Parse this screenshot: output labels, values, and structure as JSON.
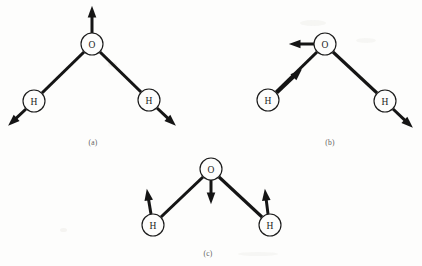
{
  "figure": {
    "background_color": "#fdfdfc",
    "ink_color": "#151515",
    "width": 422,
    "height": 266,
    "panels": [
      {
        "id": "a",
        "caption": "(a)",
        "caption_x": 93,
        "caption_y": 138,
        "mode_name": "symmetric stretch",
        "atoms": [
          {
            "label": "O",
            "name": "oxygen",
            "cx": 92,
            "cy": 44,
            "r": 11
          },
          {
            "label": "H",
            "name": "hydrogen-left",
            "cx": 34,
            "cy": 101,
            "r": 11
          },
          {
            "label": "H",
            "name": "hydrogen-right",
            "cx": 149,
            "cy": 100,
            "r": 11
          }
        ],
        "bonds": [
          {
            "name": "bond-o-h-left",
            "x1": 84,
            "y1": 52,
            "x2": 42,
            "y2": 93
          },
          {
            "name": "bond-o-h-right",
            "x1": 100,
            "y1": 52,
            "x2": 141,
            "y2": 92
          }
        ],
        "arrows": [
          {
            "name": "arrow-oxygen-up",
            "x1": 92,
            "y1": 33,
            "x2": 92,
            "y2": 7,
            "head": "up"
          },
          {
            "name": "arrow-hydrogen-left-down",
            "x1": 26,
            "y1": 109,
            "x2": 9,
            "y2": 125,
            "head": "down-left"
          },
          {
            "name": "arrow-hydrogen-right-down",
            "x1": 157,
            "y1": 108,
            "x2": 175,
            "y2": 125,
            "head": "down-right"
          }
        ]
      },
      {
        "id": "b",
        "caption": "(b)",
        "caption_x": 330,
        "caption_y": 138,
        "mode_name": "asymmetric stretch",
        "atoms": [
          {
            "label": "O",
            "name": "oxygen",
            "cx": 325,
            "cy": 44,
            "r": 11
          },
          {
            "label": "H",
            "name": "hydrogen-left",
            "cx": 268,
            "cy": 100,
            "r": 11
          },
          {
            "label": "H",
            "name": "hydrogen-right",
            "cx": 385,
            "cy": 101,
            "r": 11
          }
        ],
        "bonds": [
          {
            "name": "bond-o-h-left",
            "x1": 317,
            "y1": 52,
            "x2": 276,
            "y2": 92
          },
          {
            "name": "bond-o-h-right",
            "x1": 333,
            "y1": 52,
            "x2": 377,
            "y2": 93
          }
        ],
        "arrows": [
          {
            "name": "arrow-oxygen-left",
            "x1": 314,
            "y1": 44,
            "x2": 290,
            "y2": 44,
            "head": "left"
          },
          {
            "name": "arrow-hydrogen-left-toward-oxygen",
            "x1": 277,
            "y1": 93,
            "x2": 301,
            "y2": 70,
            "head": "up-right"
          },
          {
            "name": "arrow-hydrogen-right-away",
            "x1": 393,
            "y1": 109,
            "x2": 412,
            "y2": 127,
            "head": "down-right"
          }
        ]
      },
      {
        "id": "c",
        "caption": "(c)",
        "caption_x": 208,
        "caption_y": 249,
        "mode_name": "bending",
        "atoms": [
          {
            "label": "O",
            "name": "oxygen",
            "cx": 211,
            "cy": 169,
            "r": 11
          },
          {
            "label": "H",
            "name": "hydrogen-left",
            "cx": 153,
            "cy": 225,
            "r": 11
          },
          {
            "label": "H",
            "name": "hydrogen-right",
            "cx": 270,
            "cy": 225,
            "r": 11
          }
        ],
        "bonds": [
          {
            "name": "bond-o-h-left",
            "x1": 203,
            "y1": 177,
            "x2": 161,
            "y2": 217
          },
          {
            "name": "bond-o-h-right",
            "x1": 219,
            "y1": 177,
            "x2": 262,
            "y2": 217
          }
        ],
        "arrows": [
          {
            "name": "arrow-oxygen-down",
            "x1": 211,
            "y1": 180,
            "x2": 211,
            "y2": 203,
            "head": "down"
          },
          {
            "name": "arrow-hydrogen-left-up",
            "x1": 151,
            "y1": 214,
            "x2": 147,
            "y2": 190,
            "head": "up"
          },
          {
            "name": "arrow-hydrogen-right-up",
            "x1": 268,
            "y1": 214,
            "x2": 265,
            "y2": 190,
            "head": "up"
          }
        ]
      }
    ]
  }
}
